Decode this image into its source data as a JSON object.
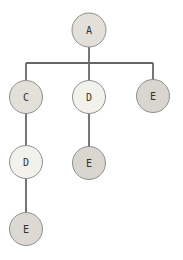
{
  "diagram": {
    "type": "tree",
    "canvas": {
      "width": 183,
      "height": 260,
      "background": "#ffffff"
    },
    "styles": {
      "edge_color": "#666666",
      "edge_width": 1.8,
      "node_border_color": "#8f8f8f",
      "node_border_width": 1,
      "text_color": "#333333",
      "fill_shaded_light": "#e3e0da",
      "fill_white": "#f3f1ec",
      "fill_shaded_dark": "#d9d6cf"
    },
    "nodes": [
      {
        "id": "A",
        "label": "A",
        "x": 89,
        "y": 30,
        "r": 17,
        "fill": "#e3e0da"
      },
      {
        "id": "C",
        "label": "C",
        "x": 26,
        "y": 97,
        "r": 16.5,
        "fill": "#e3e0da"
      },
      {
        "id": "D1",
        "label": "D",
        "x": 89,
        "y": 97,
        "r": 16.5,
        "fill": "#f3f1ec"
      },
      {
        "id": "E1",
        "label": "E",
        "x": 153,
        "y": 96,
        "r": 16.5,
        "fill": "#d9d6cf"
      },
      {
        "id": "D2",
        "label": "D",
        "x": 26,
        "y": 162,
        "r": 16.5,
        "fill": "#f3f1ec"
      },
      {
        "id": "E2",
        "label": "E",
        "x": 89,
        "y": 163,
        "r": 16.5,
        "fill": "#d9d6cf"
      },
      {
        "id": "E3",
        "label": "E",
        "x": 26,
        "y": 229,
        "r": 16.5,
        "fill": "#dcd9d3"
      }
    ],
    "edges": [
      {
        "from": "A",
        "to": "C"
      },
      {
        "from": "A",
        "to": "D1"
      },
      {
        "from": "A",
        "to": "E1"
      },
      {
        "from": "C",
        "to": "D2"
      },
      {
        "from": "D1",
        "to": "E2"
      },
      {
        "from": "D2",
        "to": "E3"
      }
    ],
    "segments": [
      [
        89,
        47,
        89,
        80
      ],
      [
        26,
        63,
        153,
        63
      ],
      [
        26,
        63,
        26,
        81
      ],
      [
        153,
        63,
        153,
        80
      ],
      [
        26,
        113,
        26,
        146
      ],
      [
        89,
        114,
        89,
        147
      ],
      [
        26,
        178,
        26,
        213
      ]
    ]
  }
}
